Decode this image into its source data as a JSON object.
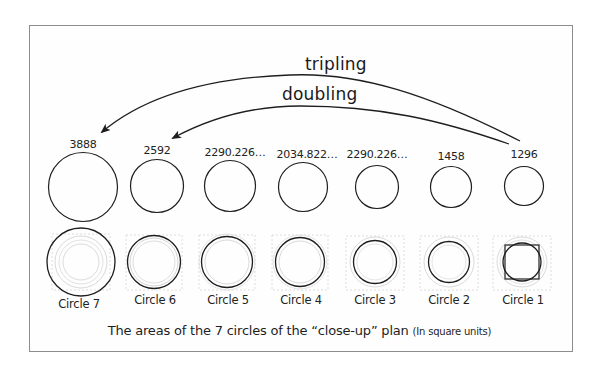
{
  "figure": {
    "arrows": [
      {
        "label": "tripling",
        "from": "Circle 1",
        "to": "Circle 7"
      },
      {
        "label": "doubling",
        "from": "Circle 1",
        "to": "Circle 6"
      }
    ],
    "circles": [
      {
        "name": "Circle 7",
        "area": "3888"
      },
      {
        "name": "Circle 6",
        "area": "2592"
      },
      {
        "name": "Circle 5",
        "area": "2290.226…"
      },
      {
        "name": "Circle 4",
        "area": "2034.822…"
      },
      {
        "name": "Circle 3",
        "area": "1640.25"
      },
      {
        "name": "Circle 2",
        "area": "1458"
      },
      {
        "name": "Circle 1",
        "area": "1296"
      }
    ],
    "caption": {
      "main": "The areas of the 7 circles of the “close-up” plan",
      "note": "(In square units)"
    }
  },
  "colors": {
    "line": "#1e1e1e",
    "frame": "#8d8d8d",
    "faint": "#c8c8c8"
  }
}
